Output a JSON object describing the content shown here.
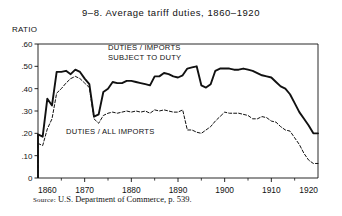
{
  "figure": {
    "number": "9-8.",
    "title": "9–8.    Average  tariff  duties,  1860–1920",
    "axis_corner_label": "RATIO",
    "source_prefix": "Source:",
    "source_text": "U.S. Department of Commerce, p. 539."
  },
  "annotations": {
    "upper_line_label_1": "DUTIES / IMPORTS",
    "upper_line_label_2": "SUBJECT TO DUTY",
    "lower_line_label": "DUTIES / ALL IMPORTS"
  },
  "chart_data": {
    "type": "line",
    "xlabel": "",
    "ylabel": "RATIO",
    "xlim": [
      1860,
      1920
    ],
    "ylim": [
      0,
      0.6
    ],
    "grid": false,
    "legend_position": "inline-annotations",
    "x_ticks_major": [
      1860,
      1870,
      1880,
      1890,
      1900,
      1910,
      1920
    ],
    "x_ticks_minor": [
      1865,
      1875,
      1885,
      1895,
      1905,
      1915
    ],
    "y_ticks": [
      0,
      0.1,
      0.2,
      0.3,
      0.4,
      0.5,
      0.6
    ],
    "y_tick_labels": [
      "0",
      ".10",
      ".20",
      ".30",
      ".40",
      ".50",
      ".60"
    ],
    "x_tick_labels": [
      "1860",
      "1870",
      "1880",
      "1890",
      "1900",
      "1910",
      "1920"
    ],
    "series": [
      {
        "name": "DUTIES / IMPORTS SUBJECT TO DUTY",
        "style": "solid",
        "color": "#111111",
        "x": [
          1860,
          1861,
          1862,
          1863,
          1864,
          1865,
          1866,
          1867,
          1868,
          1869,
          1870,
          1871,
          1872,
          1873,
          1874,
          1875,
          1876,
          1877,
          1878,
          1879,
          1880,
          1881,
          1882,
          1883,
          1884,
          1885,
          1886,
          1887,
          1888,
          1889,
          1890,
          1891,
          1892,
          1893,
          1894,
          1895,
          1896,
          1897,
          1898,
          1899,
          1900,
          1901,
          1902,
          1903,
          1904,
          1905,
          1906,
          1907,
          1908,
          1909,
          1910,
          1911,
          1912,
          1913,
          1914,
          1915,
          1916,
          1917,
          1918,
          1919,
          1920
        ],
        "values": [
          0.195,
          0.185,
          0.355,
          0.325,
          0.475,
          0.475,
          0.48,
          0.465,
          0.485,
          0.475,
          0.445,
          0.42,
          0.275,
          0.285,
          0.385,
          0.4,
          0.43,
          0.425,
          0.425,
          0.435,
          0.435,
          0.43,
          0.425,
          0.42,
          0.415,
          0.455,
          0.455,
          0.47,
          0.465,
          0.455,
          0.45,
          0.46,
          0.49,
          0.495,
          0.5,
          0.415,
          0.405,
          0.42,
          0.48,
          0.49,
          0.49,
          0.49,
          0.485,
          0.485,
          0.49,
          0.485,
          0.48,
          0.47,
          0.46,
          0.455,
          0.45,
          0.43,
          0.41,
          0.4,
          0.375,
          0.335,
          0.295,
          0.265,
          0.235,
          0.2,
          0.2
        ]
      },
      {
        "name": "DUTIES / ALL IMPORTS",
        "style": "dashed",
        "color": "#111111",
        "x": [
          1860,
          1861,
          1862,
          1863,
          1864,
          1865,
          1866,
          1867,
          1868,
          1869,
          1870,
          1871,
          1872,
          1873,
          1874,
          1875,
          1876,
          1877,
          1878,
          1879,
          1880,
          1881,
          1882,
          1883,
          1884,
          1885,
          1886,
          1887,
          1888,
          1889,
          1890,
          1891,
          1892,
          1893,
          1894,
          1895,
          1896,
          1897,
          1898,
          1899,
          1900,
          1901,
          1902,
          1903,
          1904,
          1905,
          1906,
          1907,
          1908,
          1909,
          1910,
          1911,
          1912,
          1913,
          1914,
          1915,
          1916,
          1917,
          1918,
          1919,
          1920
        ],
        "values": [
          0.155,
          0.145,
          0.22,
          0.265,
          0.38,
          0.4,
          0.425,
          0.445,
          0.455,
          0.445,
          0.425,
          0.405,
          0.265,
          0.245,
          0.28,
          0.29,
          0.295,
          0.29,
          0.295,
          0.3,
          0.295,
          0.3,
          0.295,
          0.3,
          0.29,
          0.305,
          0.3,
          0.305,
          0.3,
          0.295,
          0.295,
          0.305,
          0.215,
          0.215,
          0.205,
          0.2,
          0.215,
          0.23,
          0.255,
          0.275,
          0.295,
          0.29,
          0.29,
          0.29,
          0.285,
          0.28,
          0.265,
          0.265,
          0.275,
          0.27,
          0.255,
          0.25,
          0.23,
          0.215,
          0.21,
          0.18,
          0.15,
          0.11,
          0.08,
          0.065,
          0.065
        ]
      }
    ]
  }
}
